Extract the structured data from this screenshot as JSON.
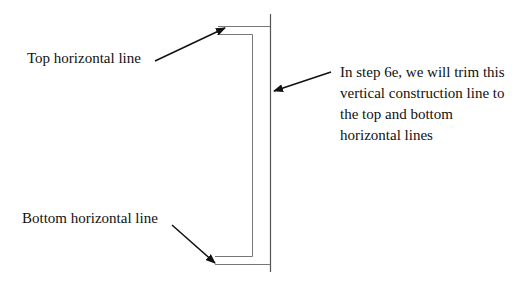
{
  "labels": {
    "top": "Top horizontal line",
    "bottom": "Bottom horizontal line",
    "note_lines": [
      "In step 6e, we will trim this",
      "vertical construction line to",
      "the top and bottom",
      "horizontal lines"
    ]
  },
  "colors": {
    "line": "#555555",
    "arrow": "#111111",
    "text": "#111111"
  }
}
